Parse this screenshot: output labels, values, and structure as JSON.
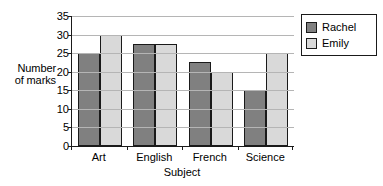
{
  "chart_data": {
    "type": "bar",
    "title": "",
    "subtitle": "",
    "xlabel": "Subject",
    "ylabel": "Number of marks",
    "categories": [
      "Art",
      "English",
      "French",
      "Science"
    ],
    "series": [
      {
        "name": "Rachel",
        "color": "#808080",
        "values": [
          25,
          27.5,
          22.5,
          15
        ]
      },
      {
        "name": "Emily",
        "color": "#d9d9d9",
        "values": [
          30,
          27.5,
          20,
          25
        ]
      }
    ],
    "ylim": [
      0,
      35
    ],
    "ytick_step": 5,
    "yticks": [
      0,
      5,
      10,
      15,
      20,
      25,
      30,
      35
    ],
    "ytick_labels": [
      "0",
      "5",
      "10",
      "15",
      "20",
      "25",
      "30",
      "35"
    ],
    "grid": true,
    "grid_axis": "y",
    "legend_position": "right-outside",
    "bar_edge_color": "#1a1a1a",
    "axis_color": "#1a1a1a",
    "gridline_color": "#b5b5b5",
    "background": "#ffffff"
  },
  "axis_labels": {
    "y_line_1": "Number",
    "y_line_2": "of marks",
    "x_title": "Subject"
  }
}
